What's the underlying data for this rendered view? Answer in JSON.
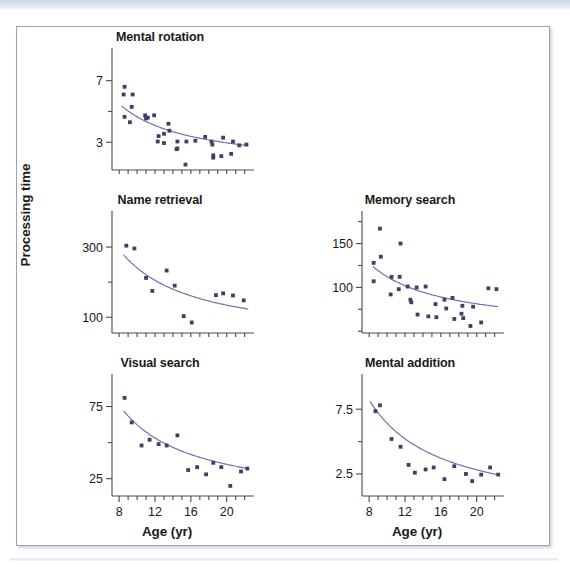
{
  "figure": {
    "ylabel": "Processing time",
    "xlabel": "Age (yr)",
    "marker_color": "#3d3f6b",
    "curve_color": "#6a76ad",
    "axis_color": "#4a4a4a",
    "frame_color": "#9aa3b8"
  },
  "panels": [
    {
      "id": "mental-rotation",
      "title": "Mental rotation",
      "ytick_labels": [
        "7",
        "3"
      ],
      "ytick_values": [
        7,
        3
      ],
      "xtick_labels": [],
      "show_xlabel": false
    },
    {
      "id": "name-retrieval",
      "title": "Name retrieval",
      "ytick_labels": [
        "300",
        "100"
      ],
      "ytick_values": [
        300,
        100
      ],
      "xtick_labels": [],
      "show_xlabel": false
    },
    {
      "id": "memory-search",
      "title": "Memory search",
      "ytick_labels": [
        "150",
        "100"
      ],
      "ytick_values": [
        150,
        100
      ],
      "xtick_labels": [],
      "show_xlabel": false
    },
    {
      "id": "visual-search",
      "title": "Visual search",
      "ytick_labels": [
        "75",
        "25"
      ],
      "ytick_values": [
        75,
        25
      ],
      "xtick_labels": [
        "8",
        "12",
        "16",
        "20"
      ],
      "show_xlabel": true,
      "xlabel": "Age (yr)"
    },
    {
      "id": "mental-addition",
      "title": "Mental addition",
      "ytick_labels": [
        "7.5",
        "2.5"
      ],
      "ytick_values": [
        7.5,
        2.5
      ],
      "xtick_labels": [
        "8",
        "12",
        "16",
        "20"
      ],
      "show_xlabel": true,
      "xlabel": "Age (yr)"
    }
  ],
  "chart_data": {
    "type": "scatter",
    "xlabel": "Age (yr)",
    "ylabel": "Processing time",
    "xlim": [
      7.2,
      22.6
    ],
    "grid": false,
    "legend": "none",
    "panels": [
      {
        "name": "Mental rotation",
        "ylim": [
          1.2,
          8.6
        ],
        "yticks": [
          3,
          7
        ],
        "xticks_labeled": [],
        "points": [
          [
            8.6,
            6.6
          ],
          [
            8.5,
            6.1
          ],
          [
            9.5,
            6.1
          ],
          [
            9.4,
            5.3
          ],
          [
            8.6,
            4.65
          ],
          [
            9.2,
            4.3
          ],
          [
            10.9,
            4.75
          ],
          [
            11.0,
            4.55
          ],
          [
            11.2,
            4.6
          ],
          [
            11.9,
            4.75
          ],
          [
            13.5,
            4.2
          ],
          [
            13.6,
            3.75
          ],
          [
            12.4,
            3.4
          ],
          [
            13.0,
            3.55
          ],
          [
            12.3,
            3.05
          ],
          [
            13.0,
            2.95
          ],
          [
            14.5,
            3.05
          ],
          [
            14.5,
            2.6
          ],
          [
            14.4,
            2.55
          ],
          [
            15.5,
            3.05
          ],
          [
            15.4,
            1.55
          ],
          [
            16.5,
            3.1
          ],
          [
            17.6,
            3.35
          ],
          [
            18.3,
            3.05
          ],
          [
            18.4,
            2.85
          ],
          [
            18.5,
            2.15
          ],
          [
            18.5,
            2.0
          ],
          [
            19.4,
            2.1
          ],
          [
            19.6,
            3.3
          ],
          [
            20.7,
            3.05
          ],
          [
            20.5,
            2.25
          ],
          [
            21.4,
            2.8
          ],
          [
            22.2,
            2.85
          ]
        ],
        "fit_curve": {
          "form": "a + b/x",
          "x_start": 8.3,
          "x_end": 22.4,
          "y_start": 5.35,
          "y_end": 2.78
        }
      },
      {
        "name": "Name retrieval",
        "ylim": [
          55,
          380
        ],
        "yticks": [
          100,
          300
        ],
        "xticks_labeled": [],
        "points": [
          [
            8.8,
            304
          ],
          [
            9.7,
            296
          ],
          [
            11.0,
            212
          ],
          [
            11.7,
            175
          ],
          [
            13.3,
            233
          ],
          [
            14.2,
            190
          ],
          [
            15.2,
            103
          ],
          [
            16.1,
            85
          ],
          [
            18.8,
            163
          ],
          [
            19.6,
            168
          ],
          [
            20.7,
            162
          ],
          [
            21.9,
            148
          ]
        ],
        "fit_curve": {
          "form": "a + b/x",
          "x_start": 8.5,
          "x_end": 22.4,
          "y_start": 278,
          "y_end": 123
        }
      },
      {
        "name": "Memory search",
        "ylim": [
          48,
          178
        ],
        "yticks": [
          100,
          150
        ],
        "xticks_labeled": [],
        "points": [
          [
            9.2,
            167
          ],
          [
            8.5,
            128
          ],
          [
            9.3,
            135
          ],
          [
            8.5,
            107
          ],
          [
            11.5,
            150
          ],
          [
            10.5,
            112
          ],
          [
            11.4,
            112
          ],
          [
            10.4,
            92
          ],
          [
            11.3,
            98
          ],
          [
            12.3,
            101
          ],
          [
            13.3,
            100
          ],
          [
            14.3,
            101
          ],
          [
            12.6,
            86
          ],
          [
            12.7,
            83
          ],
          [
            13.4,
            69
          ],
          [
            14.6,
            67
          ],
          [
            15.4,
            81
          ],
          [
            15.5,
            66
          ],
          [
            16.4,
            86
          ],
          [
            17.3,
            88
          ],
          [
            16.6,
            76
          ],
          [
            17.5,
            64
          ],
          [
            18.4,
            79
          ],
          [
            18.3,
            70
          ],
          [
            18.5,
            65
          ],
          [
            19.3,
            56
          ],
          [
            19.6,
            78
          ],
          [
            20.5,
            60
          ],
          [
            21.3,
            99
          ],
          [
            22.2,
            98
          ]
        ],
        "fit_curve": {
          "form": "a + b/x",
          "x_start": 8.4,
          "x_end": 22.4,
          "y_start": 124,
          "y_end": 78
        }
      },
      {
        "name": "Visual search",
        "ylim": [
          13,
          92
        ],
        "yticks": [
          25,
          75
        ],
        "xticks_labeled": [
          8,
          12,
          16,
          20
        ],
        "points": [
          [
            8.6,
            81
          ],
          [
            9.4,
            64
          ],
          [
            10.5,
            48
          ],
          [
            11.4,
            52
          ],
          [
            12.4,
            49
          ],
          [
            13.3,
            48
          ],
          [
            14.5,
            55
          ],
          [
            15.7,
            31
          ],
          [
            16.7,
            33
          ],
          [
            17.7,
            28
          ],
          [
            18.5,
            36
          ],
          [
            19.4,
            33
          ],
          [
            20.4,
            20
          ],
          [
            21.6,
            30
          ],
          [
            22.3,
            32
          ]
        ],
        "fit_curve": {
          "form": "a + b/x",
          "x_start": 8.5,
          "x_end": 22.4,
          "y_start": 72,
          "y_end": 32
        }
      },
      {
        "name": "Mental addition",
        "ylim": [
          0.8,
          9.6
        ],
        "yticks": [
          2.5,
          7.5
        ],
        "xticks_labeled": [
          8,
          12,
          16,
          20
        ],
        "points": [
          [
            8.7,
            7.35
          ],
          [
            9.2,
            7.8
          ],
          [
            10.5,
            5.2
          ],
          [
            11.5,
            4.6
          ],
          [
            12.4,
            3.2
          ],
          [
            13.1,
            2.6
          ],
          [
            14.3,
            2.85
          ],
          [
            15.2,
            3.0
          ],
          [
            16.4,
            2.1
          ],
          [
            17.5,
            3.1
          ],
          [
            18.8,
            2.5
          ],
          [
            19.5,
            1.95
          ],
          [
            20.5,
            2.45
          ],
          [
            21.5,
            3.0
          ],
          [
            22.4,
            2.45
          ]
        ],
        "fit_curve": {
          "form": "a + b/x",
          "x_start": 8.1,
          "x_end": 22.5,
          "y_start": 8.1,
          "y_end": 2.42
        }
      }
    ]
  }
}
